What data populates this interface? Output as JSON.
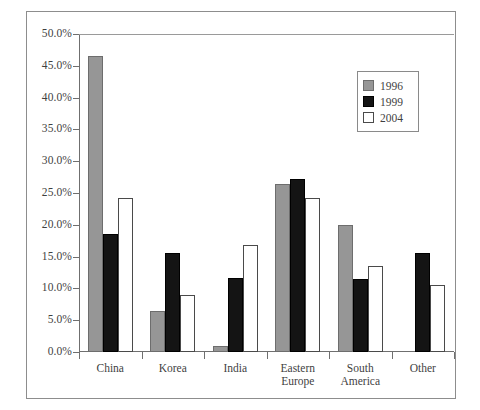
{
  "chart_data": {
    "type": "bar",
    "title": "",
    "subtitle": "",
    "xlabel": "",
    "ylabel": "",
    "categories": [
      "China",
      "Korea",
      "India",
      "Eastern Europe",
      "South America",
      "Other"
    ],
    "category_label_lines": [
      [
        "China"
      ],
      [
        "Korea"
      ],
      [
        "India"
      ],
      [
        "Eastern",
        "Europe"
      ],
      [
        "South",
        "America"
      ],
      [
        "Other"
      ]
    ],
    "series": [
      {
        "name": "1996",
        "color": "#969696",
        "values": [
          46.5,
          6.5,
          0.9,
          26.4,
          20.0,
          0.0
        ]
      },
      {
        "name": "1999",
        "color": "#141414",
        "values": [
          18.6,
          15.6,
          11.7,
          27.2,
          11.5,
          15.6
        ]
      },
      {
        "name": "2004",
        "color": "#ffffff",
        "values": [
          24.2,
          8.9,
          16.9,
          24.2,
          13.5,
          10.6
        ]
      }
    ],
    "ylim": [
      0,
      50
    ],
    "ytick_values": [
      0,
      5,
      10,
      15,
      20,
      25,
      30,
      35,
      40,
      45,
      50
    ],
    "ytick_labels": [
      "0.0%",
      "5.0%",
      "10.0%",
      "15.0%",
      "20.0%",
      "25.0%",
      "30.0%",
      "35.0%",
      "40.0%",
      "45.0%",
      "50.0%"
    ],
    "grid": false,
    "legend_position": "upper right",
    "legend_entries": [
      "1996",
      "1999",
      "2004"
    ]
  },
  "colors": {
    "series_1996": "#969696",
    "series_1999": "#141414",
    "series_2004": "#ffffff",
    "axis": "#6f6f6f",
    "frame": "#8d8d8d",
    "text": "#3f3f3f",
    "background": "#ffffff"
  }
}
